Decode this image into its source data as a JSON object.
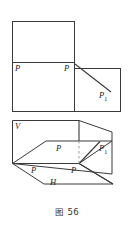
{
  "figure": {
    "caption": "图 56",
    "stroke_color": "#3a3a3a",
    "dashed_color": "#9a9a9a",
    "background_color": "#ffffff",
    "top_diagram": {
      "name": "unfolded-projection-planes",
      "description": "Two adjoining rectangles with a ray from the shared corner",
      "labels": [
        {
          "id": "p-left-top",
          "text": "P",
          "x": 15,
          "y": 65
        },
        {
          "id": "p-center-top",
          "text": "P",
          "x": 70,
          "y": 65
        },
        {
          "id": "p1-top",
          "text": "P",
          "sub": "1",
          "x": 100,
          "y": 94
        }
      ]
    },
    "bottom_diagram": {
      "name": "folded-projection-planes-3d",
      "description": "Pictorial view of vertical plane V and horizontal plane H with points P and P1",
      "labels": [
        {
          "id": "v-plane",
          "text": "V",
          "x": 15,
          "y": 123
        },
        {
          "id": "p-upper-3d",
          "text": "P",
          "x": 57,
          "y": 145
        },
        {
          "id": "p1-3d",
          "text": "P",
          "sub": "1",
          "x": 101,
          "y": 146
        },
        {
          "id": "p-lower-left-3d",
          "text": "P",
          "x": 32,
          "y": 167
        },
        {
          "id": "p-lower-right-3d",
          "text": "P",
          "x": 72,
          "y": 167
        },
        {
          "id": "h-plane",
          "text": "H",
          "x": 50,
          "y": 180
        }
      ]
    }
  }
}
